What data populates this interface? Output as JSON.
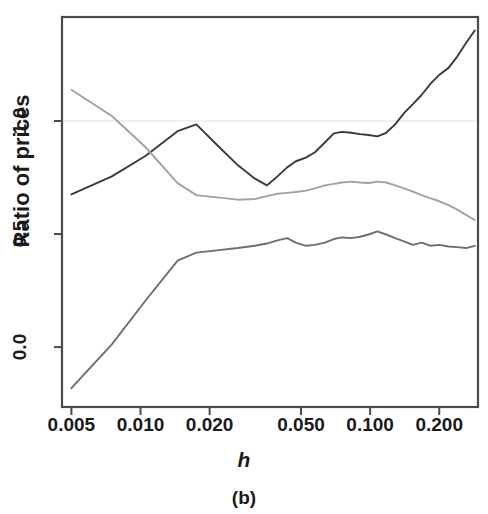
{
  "chart_data": {
    "type": "line",
    "title": "",
    "caption": "(b)",
    "xlabel": "h",
    "ylabel": "Ratio of prices",
    "xscale": "log",
    "yscale": "linear",
    "xlim": [
      0.00455,
      0.295
    ],
    "ylim": [
      -0.265,
      1.46
    ],
    "grid": true,
    "gridlines_y": [
      1.0
    ],
    "legend": "none",
    "xticks": [
      0.005,
      0.01,
      0.02,
      0.05,
      0.1,
      0.2
    ],
    "xtick_labels": [
      "0.005",
      "0.010",
      "0.020",
      "0.050",
      "0.100",
      "0.200"
    ],
    "yticks": [
      0.0,
      0.5,
      1.0
    ],
    "ytick_labels": [
      "0.0",
      "0.5",
      "1.0"
    ],
    "series": [
      {
        "name": "rising-dark-series",
        "color": "#3a3a3a",
        "width": 1.9,
        "x": [
          0.005,
          0.0075,
          0.0105,
          0.0145,
          0.0175,
          0.0215,
          0.0265,
          0.0315,
          0.0355,
          0.0395,
          0.0435,
          0.0475,
          0.0525,
          0.0575,
          0.0635,
          0.0695,
          0.0755,
          0.0825,
          0.0905,
          0.0985,
          0.1075,
          0.1175,
          0.1285,
          0.1405,
          0.1535,
          0.1675,
          0.1835,
          0.2005,
          0.2195,
          0.2395,
          0.2615,
          0.2855
        ],
        "y": [
          0.675,
          0.755,
          0.845,
          0.955,
          0.985,
          0.895,
          0.805,
          0.745,
          0.715,
          0.755,
          0.795,
          0.822,
          0.838,
          0.862,
          0.905,
          0.945,
          0.952,
          0.948,
          0.942,
          0.938,
          0.932,
          0.948,
          0.985,
          1.035,
          1.075,
          1.115,
          1.165,
          1.205,
          1.235,
          1.285,
          1.345,
          1.4
        ]
      },
      {
        "name": "descending-light-series",
        "color": "#a2a2a2",
        "width": 1.9,
        "x": [
          0.005,
          0.0075,
          0.0105,
          0.0145,
          0.0175,
          0.0215,
          0.0265,
          0.0315,
          0.0355,
          0.0395,
          0.0435,
          0.0475,
          0.0525,
          0.0575,
          0.0635,
          0.0695,
          0.0755,
          0.0825,
          0.0905,
          0.0985,
          0.1075,
          0.1175,
          0.1285,
          0.1405,
          0.1535,
          0.1675,
          0.1835,
          0.2005,
          0.2195,
          0.2395,
          0.2615,
          0.2855
        ],
        "y": [
          1.138,
          1.022,
          0.885,
          0.725,
          0.672,
          0.662,
          0.652,
          0.655,
          0.668,
          0.678,
          0.682,
          0.686,
          0.692,
          0.702,
          0.715,
          0.722,
          0.728,
          0.732,
          0.728,
          0.726,
          0.732,
          0.728,
          0.715,
          0.702,
          0.688,
          0.672,
          0.658,
          0.645,
          0.628,
          0.608,
          0.585,
          0.562
        ]
      },
      {
        "name": "rising-plateau-series",
        "color": "#6e6e6e",
        "width": 1.9,
        "x": [
          0.005,
          0.0075,
          0.0105,
          0.0145,
          0.0175,
          0.0215,
          0.0265,
          0.0315,
          0.0355,
          0.0395,
          0.0435,
          0.0475,
          0.0525,
          0.0575,
          0.0635,
          0.0695,
          0.0755,
          0.0825,
          0.0905,
          0.0985,
          0.1075,
          0.1175,
          0.1285,
          0.1405,
          0.1535,
          0.1675,
          0.1835,
          0.2005,
          0.2195,
          0.2395,
          0.2615,
          0.2855
        ],
        "y": [
          -0.182,
          0.012,
          0.205,
          0.382,
          0.418,
          0.428,
          0.438,
          0.448,
          0.458,
          0.472,
          0.482,
          0.462,
          0.448,
          0.452,
          0.462,
          0.478,
          0.485,
          0.482,
          0.488,
          0.498,
          0.512,
          0.498,
          0.482,
          0.468,
          0.452,
          0.462,
          0.448,
          0.452,
          0.445,
          0.442,
          0.438,
          0.448
        ]
      }
    ]
  },
  "plot_geometry": {
    "left": 62,
    "right": 478,
    "top": 17,
    "bottom": 407,
    "frame_color": "#4a4a4a",
    "grid_color": "#f0f0f0"
  }
}
